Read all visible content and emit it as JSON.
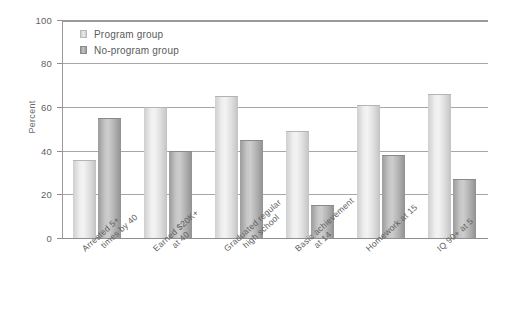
{
  "chart_data": {
    "type": "bar",
    "title": "",
    "subtitle": "",
    "xlabel": "",
    "ylabel": "Percent",
    "ylim": [
      0,
      100
    ],
    "yticks": [
      0,
      20,
      40,
      60,
      80,
      100
    ],
    "ytick_labels": [
      "0",
      "20",
      "40",
      "60",
      "80",
      "100"
    ],
    "grid": true,
    "legend_position": "top-left",
    "categories": [
      "Arrested 5+ times by 40",
      "Earned $20K+ at 40",
      "Graduated regular high school",
      "Basic achievement at 14",
      "Homework at 15",
      "IQ 90+ at 5"
    ],
    "category_lines": [
      [
        "Arrested 5+",
        "times by 40"
      ],
      [
        "Earned $20K+",
        "at 40"
      ],
      [
        "Graduated regular",
        "high school"
      ],
      [
        "Basic achievement",
        "at 14"
      ],
      [
        "Homework at 15",
        ""
      ],
      [
        "IQ 90+ at 5",
        ""
      ]
    ],
    "series": [
      {
        "name": "Program group",
        "color": "#e6e6e6",
        "values": [
          36,
          60,
          65,
          49,
          61,
          66
        ]
      },
      {
        "name": "No-program group",
        "color": "#b0b0b0",
        "values": [
          55,
          40,
          45,
          15,
          38,
          27
        ]
      }
    ]
  },
  "legend": {
    "items": [
      {
        "label": "Program group",
        "swatch": "program"
      },
      {
        "label": "No-program group",
        "swatch": "noprogram"
      }
    ]
  }
}
